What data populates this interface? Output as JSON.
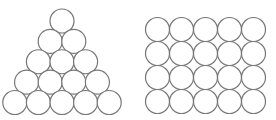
{
  "diagram": {
    "stroke_color": "#777777",
    "fill_color": "#ffffff",
    "circle_radius": 12,
    "triangle": {
      "rows": [
        1,
        2,
        3,
        4,
        5
      ],
      "total_circles": 15
    },
    "grid": {
      "rows": 4,
      "cols": 5,
      "total_circles": 20
    }
  }
}
